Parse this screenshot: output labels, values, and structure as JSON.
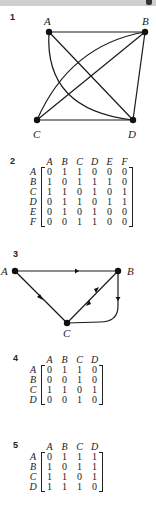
{
  "header": {
    "bar_color": "#cfcfcf"
  },
  "sections": [
    {
      "number": "1",
      "type": "undirected-graph",
      "nodes": [
        "A",
        "B",
        "C",
        "D"
      ],
      "edges": [
        [
          "A",
          "B"
        ],
        [
          "A",
          "D"
        ],
        [
          "A",
          "D",
          "curved"
        ],
        [
          "B",
          "C"
        ],
        [
          "B",
          "C",
          "curved"
        ],
        [
          "B",
          "D"
        ],
        [
          "C",
          "D"
        ]
      ]
    },
    {
      "number": "2",
      "type": "adjacency-matrix",
      "labels": [
        "A",
        "B",
        "C",
        "D",
        "E",
        "F"
      ],
      "rows": [
        [
          "0",
          "1",
          "1",
          "0",
          "0",
          "0"
        ],
        [
          "1",
          "0",
          "1",
          "1",
          "1",
          "0"
        ],
        [
          "1",
          "1",
          "0",
          "1",
          "0",
          "1"
        ],
        [
          "0",
          "1",
          "1",
          "0",
          "1",
          "1"
        ],
        [
          "0",
          "1",
          "0",
          "1",
          "0",
          "0"
        ],
        [
          "0",
          "0",
          "1",
          "1",
          "0",
          "0"
        ]
      ]
    },
    {
      "number": "3",
      "type": "directed-graph",
      "nodes": [
        "A",
        "B",
        "C"
      ],
      "edges": [
        [
          "A",
          "B"
        ],
        [
          "C",
          "A"
        ],
        [
          "B",
          "C"
        ],
        [
          "C",
          "B"
        ],
        [
          "B",
          "C",
          "curved"
        ]
      ]
    },
    {
      "number": "4",
      "type": "adjacency-matrix",
      "labels": [
        "A",
        "B",
        "C",
        "D"
      ],
      "rows": [
        [
          "0",
          "1",
          "1",
          "0"
        ],
        [
          "0",
          "0",
          "1",
          "0"
        ],
        [
          "1",
          "1",
          "0",
          "1"
        ],
        [
          "0",
          "0",
          "1",
          "0"
        ]
      ]
    },
    {
      "number": "5",
      "type": "adjacency-matrix",
      "labels": [
        "A",
        "B",
        "C",
        "D"
      ],
      "rows": [
        [
          "0",
          "1",
          "1",
          "1"
        ],
        [
          "1",
          "0",
          "1",
          "1"
        ],
        [
          "1",
          "1",
          "0",
          "1"
        ],
        [
          "1",
          "1",
          "1",
          "0"
        ]
      ]
    }
  ]
}
